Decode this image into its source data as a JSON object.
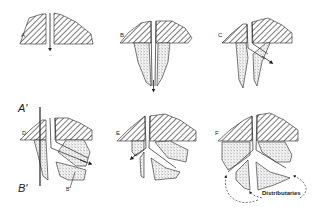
{
  "figure": {
    "panels": [
      {
        "id": "A",
        "label": "A",
        "stage": "initial channel cut through levee/bank"
      },
      {
        "id": "B",
        "label": "B",
        "stage": "channel extends with bordering sediment wedges"
      },
      {
        "id": "C",
        "label": "C",
        "stage": "flow diverts laterally"
      },
      {
        "id": "D",
        "label": "D",
        "stage": "new branch develops, section line A'-B'"
      },
      {
        "id": "E",
        "label": "E",
        "stage": "channel bifurcation"
      },
      {
        "id": "F",
        "label": "F",
        "stage": "multiple distributaries"
      }
    ],
    "section_line": {
      "top_label": "A'",
      "bottom_label": "B'"
    },
    "annotations": {
      "b_prime_small": "B'",
      "distributaries": "Distributaries"
    },
    "colors": {
      "ink": "#222222",
      "stipple": "#9a9a9a",
      "background": "#ffffff"
    }
  }
}
